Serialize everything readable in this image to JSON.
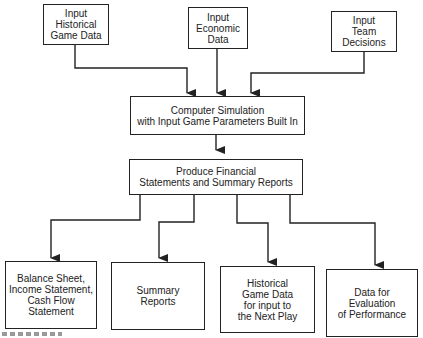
{
  "diagram": {
    "type": "flowchart",
    "inputs": [
      {
        "id": "historical",
        "label": "Input\nHistorical\nGame Data"
      },
      {
        "id": "economic",
        "label": "Input\nEconomic\nData"
      },
      {
        "id": "team",
        "label": "Input\nTeam\nDecisions"
      }
    ],
    "simulation": {
      "label": "Computer Simulation\nwith Input Game Parameters Built In"
    },
    "produce": {
      "label": "Produce Financial\nStatements and Summary Reports"
    },
    "outputs": [
      {
        "id": "statements",
        "label": "Balance Sheet,\nIncome Statement,\nCash Flow\nStatement"
      },
      {
        "id": "summary",
        "label": "Summary\nReports"
      },
      {
        "id": "historical_out",
        "label": "Historical\nGame Data\nfor input to\nthe Next Play"
      },
      {
        "id": "evaluation",
        "label": "Data for\nEvaluation\nof Performance"
      }
    ],
    "edges": [
      [
        "historical",
        "simulation"
      ],
      [
        "economic",
        "simulation"
      ],
      [
        "team",
        "simulation"
      ],
      [
        "simulation",
        "produce"
      ],
      [
        "produce",
        "statements"
      ],
      [
        "produce",
        "summary"
      ],
      [
        "produce",
        "historical_out"
      ],
      [
        "produce",
        "evaluation"
      ]
    ]
  }
}
